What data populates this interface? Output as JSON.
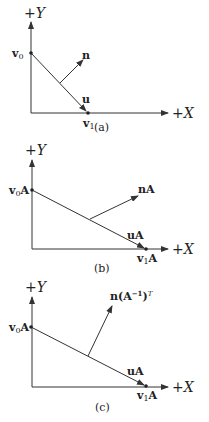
{
  "panels": [
    {
      "id": "a",
      "caption": "(a)",
      "y_axis_label": "+Y",
      "x_axis_label": "+X",
      "v0_label": "v",
      "v0_sub": "0",
      "v1_label": "v",
      "v1_sub": "1",
      "u_label": "u",
      "n_label": "n"
    },
    {
      "id": "b",
      "caption": "(b)",
      "y_axis_label": "+Y",
      "x_axis_label": "+X",
      "v0_label": "v",
      "v0_sub": "0",
      "v0_suffix": "A",
      "v1_label": "v",
      "v1_sub": "1",
      "v1_suffix": "A",
      "u_label": "uA",
      "n_label": "nA"
    },
    {
      "id": "c",
      "caption": "(c)",
      "y_axis_label": "+Y",
      "x_axis_label": "+X",
      "v0_label": "v",
      "v0_sub": "0",
      "v0_suffix": "A",
      "v1_label": "v",
      "v1_sub": "1",
      "v1_suffix": "A",
      "u_label": "uA",
      "n_label": "n(A",
      "n_sup": "−1",
      "n_close": ")",
      "n_sup2": "T"
    }
  ]
}
